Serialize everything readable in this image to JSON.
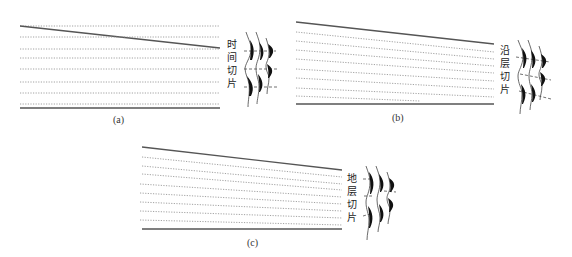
{
  "colors": {
    "line": "#555555",
    "dotted": "#888888",
    "fill": "#111111",
    "text": "#222222"
  },
  "panels": [
    {
      "id": "a",
      "caption": "(a)",
      "label_chars": [
        "时",
        "间",
        "切",
        "片"
      ],
      "label": "时间切片",
      "slice_type": "time-slice"
    },
    {
      "id": "b",
      "caption": "(b)",
      "label_chars": [
        "沿",
        "层",
        "切",
        "片"
      ],
      "label": "沿层切片",
      "slice_type": "horizon-slice"
    },
    {
      "id": "c",
      "caption": "(c)",
      "label_chars": [
        "地",
        "层",
        "切",
        "片"
      ],
      "label": "地层切片",
      "slice_type": "stratal-slice"
    }
  ]
}
